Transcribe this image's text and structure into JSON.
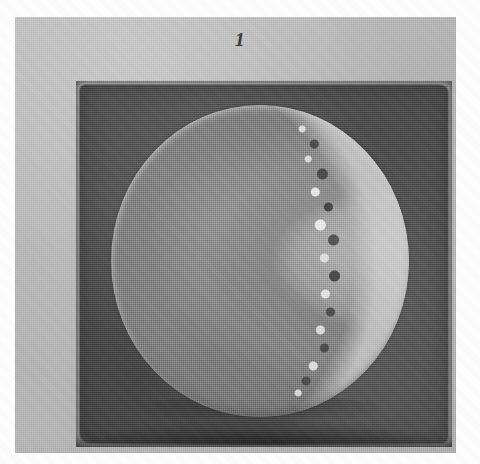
{
  "figure": {
    "number_label": "1",
    "caption": "",
    "kind": "halftone photographic plate"
  },
  "plate": {
    "mount_label": "",
    "background_color": "#bdbdbd",
    "dark_field_color": "#585858",
    "disc_color": "#878787",
    "crescent_color": "#d4d4d4",
    "speckle_dark_color": "#3a3a3a",
    "speckle_light_color": "#f0f0f0",
    "page_color": "#ffffff"
  },
  "specimen": {
    "shape": "circular disc",
    "label": "",
    "crescent_side": "right",
    "notes": ""
  }
}
